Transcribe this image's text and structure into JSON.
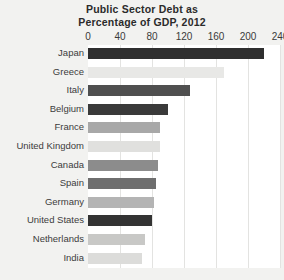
{
  "chart_data": {
    "type": "bar",
    "orientation": "horizontal",
    "title": "Public Sector Debt as Percentage of GDP, 2012",
    "title_line1": "Public Sector Debt as",
    "title_line2": "Percentage of GDP, 2012",
    "xlabel": "",
    "ylabel": "",
    "xlim": [
      0,
      240
    ],
    "xticks": [
      0,
      40,
      80,
      120,
      160,
      200,
      240
    ],
    "xtick_labels": [
      "0",
      "40",
      "80",
      "120",
      "160",
      "200",
      "240"
    ],
    "grid": true,
    "legend": "none",
    "categories": [
      "Japan",
      "Greece",
      "Italy",
      "Belgium",
      "France",
      "United Kingdom",
      "Canada",
      "Spain",
      "Germany",
      "United States",
      "Netherlands",
      "India"
    ],
    "values": [
      220,
      170,
      127,
      100,
      90,
      90,
      87,
      85,
      82,
      80,
      71,
      67
    ],
    "bars": [
      {
        "label": "Japan",
        "value": 220,
        "color": "#2f2f2f"
      },
      {
        "label": "Greece",
        "value": 170,
        "color": "#e8e8e6"
      },
      {
        "label": "Italy",
        "value": 127,
        "color": "#4f4f4f"
      },
      {
        "label": "Belgium",
        "value": 100,
        "color": "#3a3a3a"
      },
      {
        "label": "France",
        "value": 90,
        "color": "#a8a8a8"
      },
      {
        "label": "United Kingdom",
        "value": 90,
        "color": "#e0e0de"
      },
      {
        "label": "Canada",
        "value": 87,
        "color": "#8c8c8c"
      },
      {
        "label": "Spain",
        "value": 85,
        "color": "#6e6e6e"
      },
      {
        "label": "Germany",
        "value": 82,
        "color": "#b4b4b4"
      },
      {
        "label": "United States",
        "value": 80,
        "color": "#333333"
      },
      {
        "label": "Netherlands",
        "value": 71,
        "color": "#c8c8c6"
      },
      {
        "label": "India",
        "value": 67,
        "color": "#dcdcda"
      }
    ]
  },
  "style": {
    "background": "#f2f2f0",
    "plot_background": "#ffffff",
    "gridline_color": "#e3e3e1",
    "text_color": "#3c3c3c"
  }
}
